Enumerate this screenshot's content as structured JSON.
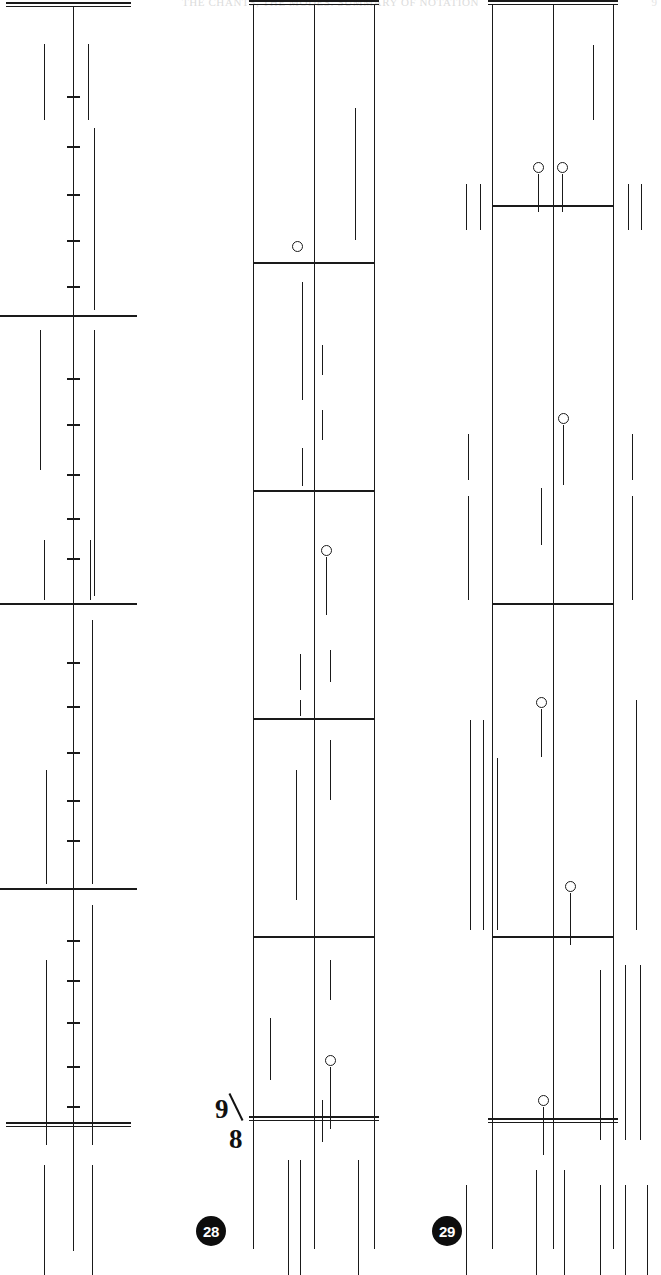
{
  "page": {
    "width": 661,
    "height": 1275,
    "background": "#ffffff",
    "ink": "#1a1a1a",
    "running_head": "THE CHANTS, THE MODES: SUMMARY OF NOTATION",
    "folio_number": "9"
  },
  "annotations": {
    "time_signature": {
      "numerator": "9",
      "denominator": "8",
      "x": 213,
      "y": 1096
    },
    "system_badges": [
      {
        "label": "28",
        "x": 196,
        "y": 1216
      },
      {
        "label": "29",
        "x": 432,
        "y": 1216
      }
    ]
  },
  "systems": [
    {
      "id": "system-left",
      "kind": "single-spine-staff",
      "x": 8,
      "width": 121,
      "top": 28,
      "bottom": 1275,
      "spine_x": 73,
      "top_double_rule_y": 30,
      "bottom_double_rule_y": 1150,
      "barlines_y": [
        315,
        603,
        888
      ],
      "tick_marks_y": [
        96,
        146,
        194,
        240,
        286,
        378,
        424,
        474,
        518,
        558,
        662,
        706,
        752,
        800,
        840,
        940,
        980,
        1022,
        1066,
        1106
      ],
      "strokes": [
        {
          "x": 44,
          "y1": 44,
          "y2": 120
        },
        {
          "x": 88,
          "y1": 44,
          "y2": 120
        },
        {
          "x": 94,
          "y1": 128,
          "y2": 310
        },
        {
          "x": 40,
          "y1": 330,
          "y2": 470
        },
        {
          "x": 94,
          "y1": 330,
          "y2": 596
        },
        {
          "x": 44,
          "y1": 540,
          "y2": 600
        },
        {
          "x": 90,
          "y1": 540,
          "y2": 600
        },
        {
          "x": 46,
          "y1": 770,
          "y2": 884
        },
        {
          "x": 92,
          "y1": 620,
          "y2": 884
        },
        {
          "x": 46,
          "y1": 960,
          "y2": 1145
        },
        {
          "x": 92,
          "y1": 905,
          "y2": 1145
        },
        {
          "x": 44,
          "y1": 1165,
          "y2": 1275
        },
        {
          "x": 92,
          "y1": 1165,
          "y2": 1275
        }
      ]
    },
    {
      "id": "system-middle",
      "kind": "boxed-staff",
      "x": 253,
      "width": 122,
      "top": 30,
      "bottom": 1275,
      "spine_x": 314,
      "top_double_rule_y": 30,
      "bottom_double_rule_y": 1146,
      "barlines_y": [
        262,
        490,
        718,
        936
      ],
      "noteheads": [
        {
          "cx": 297,
          "cy": 246,
          "stem_len": 0
        },
        {
          "cx": 326,
          "cy": 550,
          "stem_len": 58
        },
        {
          "cx": 330,
          "cy": 1060,
          "stem_len": 62
        }
      ],
      "strokes": [
        {
          "x": 355,
          "y1": 108,
          "y2": 240
        },
        {
          "x": 302,
          "y1": 282,
          "y2": 400
        },
        {
          "x": 322,
          "y1": 345,
          "y2": 375
        },
        {
          "x": 322,
          "y1": 410,
          "y2": 440
        },
        {
          "x": 302,
          "y1": 448,
          "y2": 486
        },
        {
          "x": 330,
          "y1": 650,
          "y2": 682
        },
        {
          "x": 300,
          "y1": 654,
          "y2": 690
        },
        {
          "x": 300,
          "y1": 700,
          "y2": 716
        },
        {
          "x": 330,
          "y1": 740,
          "y2": 800
        },
        {
          "x": 296,
          "y1": 770,
          "y2": 900
        },
        {
          "x": 270,
          "y1": 1018,
          "y2": 1080
        },
        {
          "x": 330,
          "y1": 960,
          "y2": 1000
        },
        {
          "x": 288,
          "y1": 1160,
          "y2": 1275
        },
        {
          "x": 300,
          "y1": 1160,
          "y2": 1275
        },
        {
          "x": 358,
          "y1": 1160,
          "y2": 1275
        },
        {
          "x": 322,
          "y1": 1100,
          "y2": 1142
        }
      ]
    },
    {
      "id": "system-right",
      "kind": "boxed-staff",
      "x": 492,
      "width": 122,
      "top": 30,
      "bottom": 1275,
      "spine_x": 553,
      "top_double_rule_y": 30,
      "bottom_double_rule_y": 1148,
      "barlines_y": [
        205,
        603,
        936
      ],
      "noteheads": [
        {
          "cx": 538,
          "cy": 167,
          "stem_len": 38
        },
        {
          "cx": 562,
          "cy": 167,
          "stem_len": 38
        },
        {
          "cx": 563,
          "cy": 418,
          "stem_len": 60
        },
        {
          "cx": 541,
          "cy": 702,
          "stem_len": 48
        },
        {
          "cx": 570,
          "cy": 886,
          "stem_len": 52
        },
        {
          "cx": 543,
          "cy": 1100,
          "stem_len": 48
        }
      ],
      "strokes": [
        {
          "x": 593,
          "y1": 45,
          "y2": 120
        },
        {
          "x": 466,
          "y1": 184,
          "y2": 230
        },
        {
          "x": 480,
          "y1": 184,
          "y2": 230
        },
        {
          "x": 628,
          "y1": 184,
          "y2": 230
        },
        {
          "x": 641,
          "y1": 184,
          "y2": 230
        },
        {
          "x": 468,
          "y1": 434,
          "y2": 480
        },
        {
          "x": 468,
          "y1": 496,
          "y2": 600
        },
        {
          "x": 541,
          "y1": 488,
          "y2": 545
        },
        {
          "x": 632,
          "y1": 434,
          "y2": 480
        },
        {
          "x": 632,
          "y1": 496,
          "y2": 600
        },
        {
          "x": 470,
          "y1": 720,
          "y2": 930
        },
        {
          "x": 483,
          "y1": 720,
          "y2": 930
        },
        {
          "x": 497,
          "y1": 758,
          "y2": 930
        },
        {
          "x": 636,
          "y1": 700,
          "y2": 930
        },
        {
          "x": 600,
          "y1": 970,
          "y2": 1140
        },
        {
          "x": 625,
          "y1": 965,
          "y2": 1140
        },
        {
          "x": 640,
          "y1": 965,
          "y2": 1140
        },
        {
          "x": 466,
          "y1": 1185,
          "y2": 1275
        },
        {
          "x": 600,
          "y1": 1185,
          "y2": 1275
        },
        {
          "x": 625,
          "y1": 1185,
          "y2": 1275
        },
        {
          "x": 647,
          "y1": 1185,
          "y2": 1275
        },
        {
          "x": 536,
          "y1": 1170,
          "y2": 1275
        },
        {
          "x": 564,
          "y1": 1170,
          "y2": 1275
        }
      ]
    }
  ]
}
